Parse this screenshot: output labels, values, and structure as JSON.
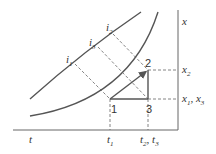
{
  "diagram": {
    "axes": {
      "horizontal_label": "t",
      "vertical_label": "x"
    },
    "points": [
      {
        "id": "1",
        "label": "1"
      },
      {
        "id": "2",
        "label": "2"
      },
      {
        "id": "3",
        "label": "3"
      }
    ],
    "curve_labels": {
      "i1": {
        "base": "i",
        "sub": "1"
      },
      "i2": {
        "base": "i",
        "sub": "2"
      },
      "i3": {
        "base": "i",
        "sub": "3"
      }
    },
    "x_ticks": {
      "t1": {
        "base": "t",
        "sub": "1"
      },
      "t23": {
        "base1": "t",
        "sub1": "2",
        "sep": ", ",
        "base2": "t",
        "sub2": "3"
      }
    },
    "y_ticks": {
      "x2": {
        "base": "x",
        "sub": "2"
      },
      "x13": {
        "base1": "x",
        "sub1": "1",
        "sep": ", ",
        "base2": "x",
        "sub2": "3"
      }
    },
    "colors": {
      "line": "#555555",
      "dashed": "#666666",
      "text": "#333333"
    }
  }
}
